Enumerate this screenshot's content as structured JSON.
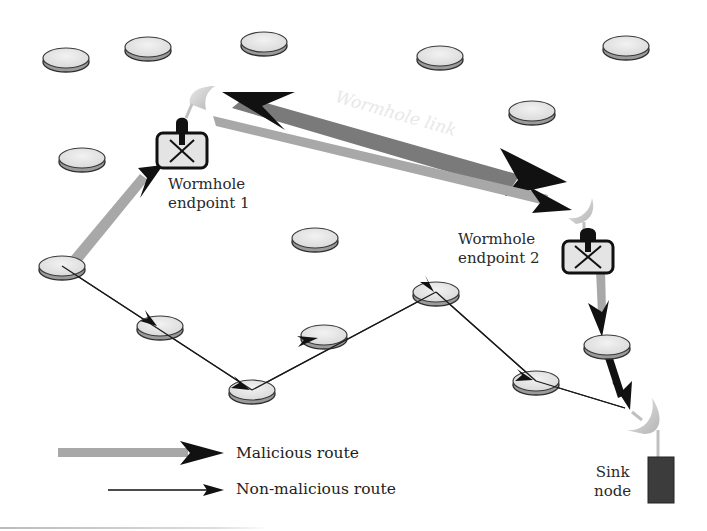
{
  "diagram": {
    "labels": {
      "wormhole_link": "Wormhole link",
      "endpoint1_line1": "Wormhole",
      "endpoint1_line2": "endpoint 1",
      "endpoint2_line1": "Wormhole",
      "endpoint2_line2": "endpoint 2",
      "sink_line1": "Sink",
      "sink_line2": "node"
    },
    "legend": {
      "malicious": "Malicious route",
      "non_malicious": "Non-malicious route"
    },
    "colors": {
      "node_fill": "#e6e6e6",
      "node_edge": "#3a3a3a",
      "malicious_shaft": "#a8a8a8",
      "wormhole_link": "#7a7a7a",
      "arrow_head": "#111111",
      "sink": "#3c3c3c",
      "antenna": "#c8c8c8"
    },
    "idle_nodes": [
      {
        "x": 66,
        "y": 60
      },
      {
        "x": 148,
        "y": 49
      },
      {
        "x": 264,
        "y": 44
      },
      {
        "x": 440,
        "y": 58
      },
      {
        "x": 626,
        "y": 48
      },
      {
        "x": 532,
        "y": 113
      },
      {
        "x": 82,
        "y": 160
      },
      {
        "x": 315,
        "y": 240
      }
    ],
    "route_nodes": [
      {
        "id": "source",
        "x": 62,
        "y": 268
      },
      {
        "id": "n2",
        "x": 160,
        "y": 328
      },
      {
        "id": "n3",
        "x": 252,
        "y": 392
      },
      {
        "id": "n4",
        "x": 324,
        "y": 337
      },
      {
        "id": "n5",
        "x": 436,
        "y": 294
      },
      {
        "id": "n6",
        "x": 536,
        "y": 383
      },
      {
        "id": "n7",
        "x": 607,
        "y": 347
      }
    ]
  }
}
